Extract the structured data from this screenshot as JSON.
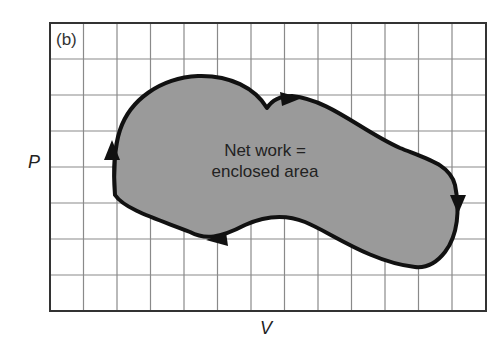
{
  "figure": {
    "panel_label": "(b)",
    "y_axis_label": "P",
    "x_axis_label": "V",
    "annotation_line1": "Net work =",
    "annotation_line2": "enclosed area"
  },
  "grid": {
    "columns": 13,
    "rows": 8,
    "line_color": "#888888",
    "border_color": "#333333"
  },
  "cycle": {
    "fill_color": "#9a9a9a",
    "stroke_color": "#111111",
    "direction": "clockwise",
    "arrows": [
      {
        "position": "left",
        "points": "up"
      },
      {
        "position": "top",
        "points": "right"
      },
      {
        "position": "right",
        "points": "down"
      },
      {
        "position": "bottom",
        "points": "left"
      }
    ]
  }
}
